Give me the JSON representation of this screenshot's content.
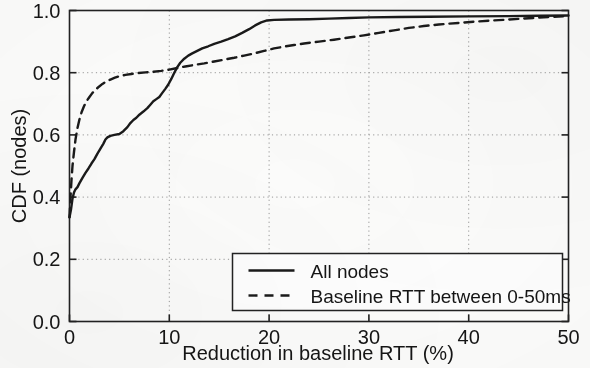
{
  "chart_data": {
    "type": "line",
    "title": "",
    "xlabel": "Reduction in baseline RTT (%)",
    "ylabel": "CDF (nodes)",
    "xlim": [
      0,
      50
    ],
    "ylim": [
      0.0,
      1.0
    ],
    "xticks": [
      0,
      10,
      20,
      30,
      40,
      50
    ],
    "xticklabels": [
      "0",
      "10",
      "20",
      "30",
      "40",
      "50"
    ],
    "yticks": [
      0.0,
      0.2,
      0.4,
      0.6,
      0.8,
      1.0
    ],
    "yticklabels": [
      "0.0",
      "0.2",
      "0.4",
      "0.6",
      "0.8",
      "1.0"
    ],
    "grid": true,
    "grid_style": "dotted",
    "legend_position": "lower right",
    "series": [
      {
        "name": "All nodes",
        "style": "solid",
        "color": "#1a1a1a",
        "points": [
          [
            0.0,
            0.335
          ],
          [
            0.15,
            0.36
          ],
          [
            0.3,
            0.395
          ],
          [
            0.45,
            0.415
          ],
          [
            0.6,
            0.425
          ],
          [
            0.8,
            0.432
          ],
          [
            1.0,
            0.445
          ],
          [
            1.3,
            0.462
          ],
          [
            1.6,
            0.478
          ],
          [
            1.9,
            0.492
          ],
          [
            2.2,
            0.508
          ],
          [
            2.5,
            0.522
          ],
          [
            2.8,
            0.54
          ],
          [
            3.1,
            0.556
          ],
          [
            3.4,
            0.572
          ],
          [
            3.6,
            0.585
          ],
          [
            3.8,
            0.592
          ],
          [
            4.1,
            0.597
          ],
          [
            4.5,
            0.6
          ],
          [
            5.0,
            0.603
          ],
          [
            5.4,
            0.612
          ],
          [
            5.8,
            0.625
          ],
          [
            6.1,
            0.638
          ],
          [
            6.4,
            0.648
          ],
          [
            6.7,
            0.655
          ],
          [
            7.0,
            0.665
          ],
          [
            7.4,
            0.675
          ],
          [
            7.8,
            0.686
          ],
          [
            8.1,
            0.697
          ],
          [
            8.4,
            0.708
          ],
          [
            8.7,
            0.715
          ],
          [
            9.0,
            0.722
          ],
          [
            9.3,
            0.735
          ],
          [
            9.6,
            0.748
          ],
          [
            9.9,
            0.762
          ],
          [
            10.2,
            0.78
          ],
          [
            10.5,
            0.8
          ],
          [
            10.8,
            0.818
          ],
          [
            11.1,
            0.832
          ],
          [
            11.5,
            0.845
          ],
          [
            11.9,
            0.855
          ],
          [
            12.3,
            0.862
          ],
          [
            12.8,
            0.87
          ],
          [
            13.3,
            0.878
          ],
          [
            13.9,
            0.885
          ],
          [
            14.5,
            0.893
          ],
          [
            15.2,
            0.9
          ],
          [
            15.9,
            0.908
          ],
          [
            16.6,
            0.917
          ],
          [
            17.3,
            0.928
          ],
          [
            18.0,
            0.94
          ],
          [
            18.6,
            0.952
          ],
          [
            19.2,
            0.962
          ],
          [
            19.8,
            0.968
          ],
          [
            20.5,
            0.97
          ],
          [
            22.0,
            0.971
          ],
          [
            24.0,
            0.972
          ],
          [
            26.0,
            0.974
          ],
          [
            28.0,
            0.976
          ],
          [
            30.0,
            0.978
          ],
          [
            33.0,
            0.979
          ],
          [
            36.0,
            0.98
          ],
          [
            40.0,
            0.981
          ],
          [
            44.0,
            0.982
          ],
          [
            47.0,
            0.983
          ],
          [
            50.0,
            0.984
          ]
        ]
      },
      {
        "name": "Baseline RTT between 0-50ms",
        "style": "dashed",
        "color": "#1a1a1a",
        "points": [
          [
            0.0,
            0.335
          ],
          [
            0.1,
            0.4
          ],
          [
            0.2,
            0.455
          ],
          [
            0.3,
            0.5
          ],
          [
            0.45,
            0.545
          ],
          [
            0.6,
            0.585
          ],
          [
            0.8,
            0.622
          ],
          [
            1.0,
            0.65
          ],
          [
            1.2,
            0.672
          ],
          [
            1.45,
            0.692
          ],
          [
            1.7,
            0.708
          ],
          [
            2.0,
            0.722
          ],
          [
            2.3,
            0.735
          ],
          [
            2.6,
            0.745
          ],
          [
            2.95,
            0.755
          ],
          [
            3.3,
            0.764
          ],
          [
            3.7,
            0.772
          ],
          [
            4.1,
            0.778
          ],
          [
            4.55,
            0.784
          ],
          [
            5.0,
            0.789
          ],
          [
            5.6,
            0.793
          ],
          [
            6.2,
            0.796
          ],
          [
            6.9,
            0.799
          ],
          [
            7.6,
            0.801
          ],
          [
            8.4,
            0.803
          ],
          [
            9.2,
            0.806
          ],
          [
            10.0,
            0.81
          ],
          [
            10.8,
            0.815
          ],
          [
            11.6,
            0.82
          ],
          [
            12.5,
            0.825
          ],
          [
            13.5,
            0.83
          ],
          [
            14.5,
            0.836
          ],
          [
            15.5,
            0.842
          ],
          [
            16.5,
            0.848
          ],
          [
            17.5,
            0.855
          ],
          [
            18.5,
            0.862
          ],
          [
            19.5,
            0.87
          ],
          [
            20.5,
            0.878
          ],
          [
            21.5,
            0.884
          ],
          [
            22.5,
            0.889
          ],
          [
            23.5,
            0.894
          ],
          [
            25.0,
            0.9
          ],
          [
            26.5,
            0.906
          ],
          [
            28.0,
            0.913
          ],
          [
            29.5,
            0.92
          ],
          [
            31.0,
            0.928
          ],
          [
            32.5,
            0.936
          ],
          [
            34.0,
            0.944
          ],
          [
            35.5,
            0.95
          ],
          [
            37.0,
            0.955
          ],
          [
            39.0,
            0.96
          ],
          [
            41.0,
            0.965
          ],
          [
            43.0,
            0.969
          ],
          [
            45.0,
            0.973
          ],
          [
            47.0,
            0.977
          ],
          [
            48.5,
            0.98
          ],
          [
            50.0,
            0.982
          ]
        ]
      }
    ],
    "legend": [
      {
        "label": "All nodes",
        "style": "solid"
      },
      {
        "label": "Baseline RTT between 0-50ms",
        "style": "dashed"
      }
    ]
  }
}
